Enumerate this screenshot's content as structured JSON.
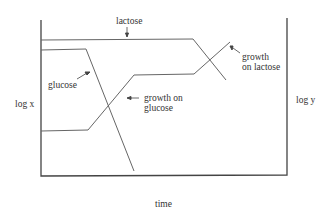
{
  "diagram": {
    "axes": {
      "x_label": "time",
      "y_left_label": "log x",
      "y_right_label": "log y"
    },
    "curves": {
      "lactose": {
        "label": "lactose"
      },
      "glucose": {
        "label": "glucose"
      },
      "growth_glucose": {
        "label_line1": "growth on",
        "label_line2": "glucose"
      },
      "growth_lactose": {
        "label_line1": "growth",
        "label_line2": "on lactose"
      }
    },
    "colors": {
      "axis": "#444444",
      "curve": "#666666",
      "text": "#333333"
    }
  }
}
